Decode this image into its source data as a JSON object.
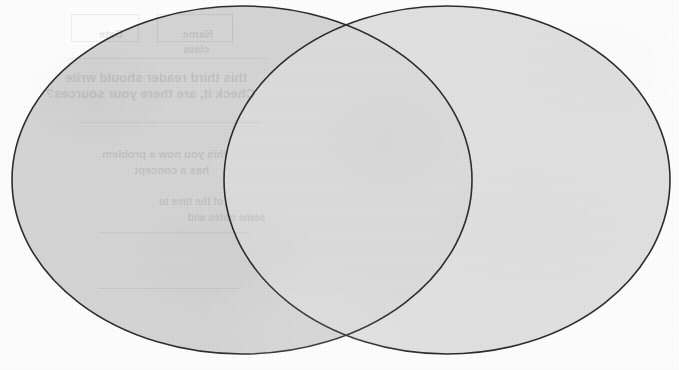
{
  "document": {
    "kind": "scanned-worksheet",
    "title": "Venn Diagram",
    "page_background_color": "#fdfdfd",
    "width_px": 679,
    "height_px": 370
  },
  "diagram": {
    "type": "venn-two-set",
    "outline_color": "#2b2b2b",
    "outline_width_px": 1.6,
    "left_circle": {
      "name": "left-set",
      "label": "",
      "center_x": 242,
      "center_y": 180,
      "radius_x": 230,
      "radius_y": 174,
      "fill_color": "#d3d3d3"
    },
    "right_circle": {
      "name": "right-set",
      "label": "",
      "center_x": 447,
      "center_y": 180,
      "radius_x": 223,
      "radius_y": 174,
      "fill_color": "#e0e0e0"
    },
    "overlap": {
      "name": "intersection-lens",
      "label": "",
      "fill_color": "#dadada",
      "top_crossing_x": 348,
      "top_crossing_y": 14,
      "bottom_crossing_x": 348,
      "bottom_crossing_y": 348
    },
    "regions": [
      {
        "id": "left-only",
        "label": "",
        "fill_color": "#d3d3d3"
      },
      {
        "id": "overlap",
        "label": "",
        "fill_color": "#dadada"
      },
      {
        "id": "right-only",
        "label": "",
        "fill_color": "#e0e0e0"
      }
    ]
  },
  "showthrough": {
    "description": "faint mirrored text bleeding through from the reverse side of the sheet",
    "opacity": 0.085,
    "lines": [
      {
        "text": "this third reader should write",
        "x": 432,
        "y": 70,
        "size": 13
      },
      {
        "text": "Check it, are there your sources?",
        "x": 424,
        "y": 86,
        "size": 13
      },
      {
        "text": "this you now a problem",
        "x": 452,
        "y": 148,
        "size": 11
      },
      {
        "text": "has a concept",
        "x": 470,
        "y": 164,
        "size": 11
      },
      {
        "text": "of the time to",
        "x": 456,
        "y": 196,
        "size": 10
      },
      {
        "text": "some notes and",
        "x": 414,
        "y": 212,
        "size": 10
      },
      {
        "text": "Name",
        "x": 466,
        "y": 28,
        "size": 11
      },
      {
        "text": "Date",
        "x": 556,
        "y": 28,
        "size": 11
      },
      {
        "text": "class",
        "x": 470,
        "y": 44,
        "size": 10
      }
    ],
    "rules": [
      {
        "x": 410,
        "y": 58,
        "width": 200
      },
      {
        "x": 418,
        "y": 122,
        "width": 180
      },
      {
        "x": 430,
        "y": 232,
        "width": 150
      },
      {
        "x": 440,
        "y": 288,
        "width": 140
      }
    ],
    "boxes": [
      {
        "x": 446,
        "y": 14,
        "width": 74,
        "height": 26
      },
      {
        "x": 540,
        "y": 14,
        "width": 66,
        "height": 26
      }
    ]
  }
}
